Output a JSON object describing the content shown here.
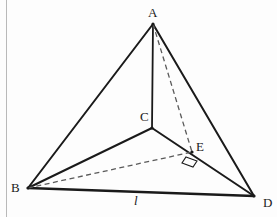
{
  "figure": {
    "width": 277,
    "height": 217,
    "background_color": "#fdfdfd",
    "stroke_color": "#1a1a1a",
    "dashed_color": "#5a5a5a",
    "border_color": "#b9b9b9"
  },
  "vertices": {
    "A": {
      "label": "A",
      "x": 153,
      "y": 24,
      "label_x": 148,
      "label_y": 6
    },
    "B": {
      "label": "B",
      "x": 28,
      "y": 188,
      "label_x": 11,
      "label_y": 181
    },
    "C": {
      "label": "C",
      "x": 152,
      "y": 128,
      "label_x": 140,
      "label_y": 110
    },
    "D": {
      "label": "D",
      "x": 254,
      "y": 196,
      "label_x": 263,
      "label_y": 196
    },
    "E": {
      "label": "E",
      "x": 192,
      "y": 152,
      "label_x": 196,
      "label_y": 140
    }
  },
  "edges": [
    {
      "name": "AB",
      "from": "A",
      "to": "B",
      "style": "solid",
      "width": 2.0
    },
    {
      "name": "AD",
      "from": "A",
      "to": "D",
      "style": "solid",
      "width": 2.0
    },
    {
      "name": "AC",
      "from": "A",
      "to": "C",
      "style": "solid",
      "width": 1.8
    },
    {
      "name": "BC",
      "from": "B",
      "to": "C",
      "style": "solid",
      "width": 2.0
    },
    {
      "name": "CD",
      "from": "C",
      "to": "D",
      "style": "solid",
      "width": 2.0
    },
    {
      "name": "BD",
      "from": "B",
      "to": "D",
      "style": "solid",
      "width": 2.4
    },
    {
      "name": "AE",
      "from": "A",
      "to": "E",
      "style": "dashed",
      "width": 1.3
    },
    {
      "name": "BE",
      "from": "B",
      "to": "E",
      "style": "dashed",
      "width": 1.3
    }
  ],
  "markers": {
    "right_angle": {
      "name": "right-angle-mark-at-E",
      "points": "186,157 197,161 193,167 182,163",
      "description": "right angle between BE and CD at E"
    }
  },
  "edge_labels": [
    {
      "name": "segment-label-l",
      "text": "l",
      "x": 134,
      "y": 194,
      "on_edge": "BD"
    }
  ]
}
